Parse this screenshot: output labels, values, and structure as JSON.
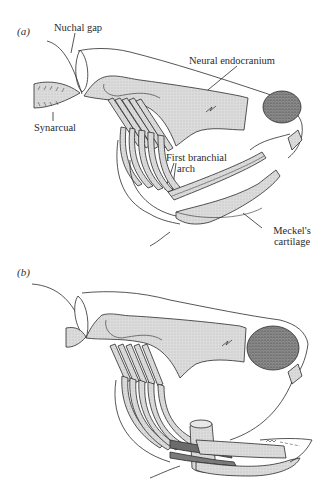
{
  "figure": {
    "panels": [
      {
        "id": "a",
        "label": "(a)",
        "annotations": {
          "nuchal_gap": "Nuchal gap",
          "neural_endocranium": "Neural endocranium",
          "synarcual": "Synarcual",
          "first_branchial_arch_line1": "First branchial",
          "first_branchial_arch_line2": "arch",
          "meckels_cartilage_line1": "Meckel's",
          "meckels_cartilage_line2": "cartilage"
        }
      },
      {
        "id": "b",
        "label": "(b)",
        "annotations": {}
      }
    ],
    "colors": {
      "cartilage_fill": "#d9d9d9",
      "orbit_fill": "#8a8a8a",
      "outline": "#2b2b2b",
      "dark_band": "#6b6b6b"
    }
  }
}
